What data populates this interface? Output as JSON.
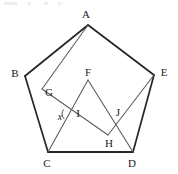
{
  "figure": {
    "kind": "geometry-diagram",
    "width": 178,
    "height": 174,
    "stroke_outer": "#262626",
    "stroke_inner": "#5a5a5a",
    "background": "#ffffff",
    "label_color": "#1a1a1a"
  },
  "points": {
    "A": {
      "label": "A",
      "x": 88,
      "y": 25,
      "lx": 86,
      "ly": 14
    },
    "B": {
      "label": "B",
      "x": 25,
      "y": 76,
      "lx": 15,
      "ly": 73
    },
    "C": {
      "label": "C",
      "x": 48,
      "y": 152,
      "lx": 47,
      "ly": 163
    },
    "D": {
      "label": "D",
      "x": 133,
      "y": 152,
      "lx": 132,
      "ly": 163
    },
    "E": {
      "label": "E",
      "x": 154,
      "y": 75,
      "lx": 164,
      "ly": 72
    },
    "F": {
      "label": "F",
      "x": 88,
      "y": 80,
      "lx": 88,
      "ly": 72
    },
    "G": {
      "label": "G",
      "x": 42,
      "y": 89,
      "lx": 49,
      "ly": 92
    },
    "H": {
      "label": "H",
      "x": 108,
      "y": 135,
      "lx": 109,
      "ly": 143
    },
    "I": {
      "label": "I",
      "x": 70,
      "y": 114,
      "lx": 78,
      "ly": 113
    },
    "J": {
      "label": "J",
      "x": 117,
      "y": 120,
      "lx": 118,
      "ly": 112
    }
  },
  "angle": {
    "label": "x",
    "at": "I",
    "lx": 60,
    "ly": 116,
    "arc_radius": 7
  },
  "edges": {
    "outer": [
      {
        "name": "AB",
        "from": "A",
        "to": "B"
      },
      {
        "name": "BC",
        "from": "B",
        "to": "C"
      },
      {
        "name": "CD",
        "from": "C",
        "to": "D"
      },
      {
        "name": "DE",
        "from": "D",
        "to": "E"
      },
      {
        "name": "EA",
        "from": "E",
        "to": "A"
      }
    ],
    "inner": [
      {
        "name": "AG",
        "from": "A",
        "to": "G"
      },
      {
        "name": "GH",
        "from": "G",
        "to": "H"
      },
      {
        "name": "CF",
        "from": "C",
        "to": "F"
      },
      {
        "name": "FD",
        "from": "F",
        "to": "D"
      },
      {
        "name": "EH",
        "from": "E",
        "to": "H"
      }
    ]
  }
}
